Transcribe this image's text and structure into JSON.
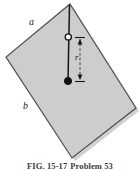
{
  "figure": {
    "kind": "physics-textbook-diagram",
    "caption": {
      "figure_number": "FIG. 15-17",
      "problem_label": "Problem 53"
    },
    "labels": {
      "side_a": "a",
      "side_b": "b",
      "distance_r": "r"
    },
    "colors": {
      "plate_fill": "#cdcdcd",
      "plate_stroke": "#4d4d4d",
      "shadow": "#a9a9a9",
      "line": "#161616",
      "pivot_fill": "#ffffff",
      "mass_fill": "#111111",
      "background": "#ffffff",
      "caption_text": "#3c3c3c"
    },
    "geometry": {
      "plate_vertices": "70,4 136,108 72,158 6,57",
      "rod_top": "70,5",
      "rod_bottom": "68,81",
      "pivot_point": "68,37",
      "mass_point": "68,81",
      "dimension_line_x": 80,
      "dimension_top_y": 37,
      "dimension_bottom_y": 81
    },
    "icon_names": {
      "pivot": "open-circle-pivot-icon",
      "mass": "filled-circle-mass-icon",
      "dimension": "dimension-arrow-icon"
    }
  }
}
